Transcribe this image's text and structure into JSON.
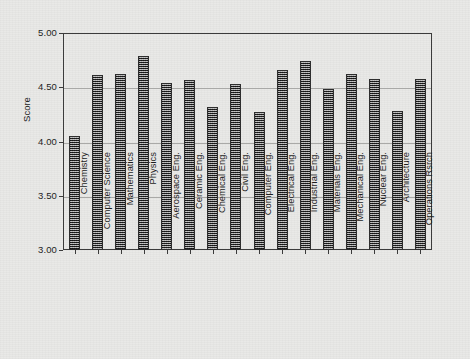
{
  "chart_data": {
    "type": "bar",
    "title": "",
    "xlabel": "",
    "ylabel": "Score",
    "ylim": [
      3.0,
      5.0
    ],
    "yticks": [
      "3.00",
      "3.50",
      "4.00",
      "4.50",
      "5.00"
    ],
    "ytick_values": [
      3.0,
      3.5,
      4.0,
      4.5,
      5.0
    ],
    "grid": true,
    "legend": null,
    "legend_position": "none",
    "categories": [
      "Chemistry",
      "Computer Science",
      "Mathematics",
      "Physics",
      "Aerospace Eng.",
      "Ceramic Eng.",
      "Chemical Eng.",
      "Civil Eng.",
      "Computer Eng.",
      "Electrical Eng.",
      "Industrial Eng.",
      "Materials  Eng.",
      "Mechanical Eng.",
      "Nuclear  Eng.",
      "Architecture",
      "Operations Rsrch"
    ],
    "values": [
      4.05,
      4.61,
      4.62,
      4.79,
      4.54,
      4.57,
      4.32,
      4.53,
      4.27,
      4.66,
      4.74,
      4.48,
      4.62,
      4.58,
      4.28,
      4.58
    ]
  },
  "style": {
    "bar_fill": "#6f6f6f",
    "bar_edge": "#2e2e2e",
    "axis_color": "#3b3b3b",
    "grid_color": "#a9a9a7",
    "background": "#e9e9e7",
    "text_color": "#1d1d1d"
  }
}
